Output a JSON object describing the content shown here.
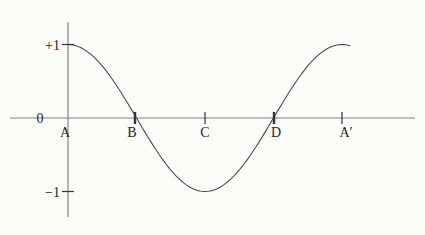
{
  "chart_data": {
    "type": "line",
    "title": "",
    "curve_function": "y = cos(x), one full period from A to A′",
    "ylim": [
      -1,
      1
    ],
    "origin_label": "0",
    "y_ticks": [
      {
        "label": "+1",
        "value": 1
      },
      {
        "label": "−1",
        "value": -1
      }
    ],
    "x_points": [
      {
        "label": "A",
        "t": 0,
        "y": 1,
        "tick": "none",
        "tick_x": 68,
        "label_x": 65
      },
      {
        "label": "B",
        "t": 0.25,
        "y": 0,
        "tick": "bold",
        "tick_x": 135,
        "label_x": 132
      },
      {
        "label": "C",
        "t": 0.5,
        "y": -1,
        "tick": "normal",
        "tick_x": 205,
        "label_x": 205
      },
      {
        "label": "D",
        "t": 0.75,
        "y": 0,
        "tick": "bold",
        "tick_x": 274,
        "label_x": 276
      },
      {
        "label": "A′",
        "t": 1,
        "y": 1,
        "tick": "normal",
        "tick_x": 342,
        "label_x": 346
      }
    ],
    "layout": {
      "width": 425,
      "height": 235,
      "x_axis_y": 118,
      "x_axis_start": 10,
      "x_axis_end": 415,
      "y_axis_x": 68,
      "y_axis_top": 22,
      "y_axis_bottom": 217,
      "unit_px": 73.5,
      "period_px": 274,
      "curve_x_start": 68,
      "curve_x_end": 350,
      "tick_half_len": 6,
      "font_size": 14
    },
    "colors": {
      "background": "#fbfbf8",
      "axis": "#848484",
      "curve": "#4d4d4d",
      "tick": "#333333",
      "text": "#1f1f1f"
    }
  }
}
